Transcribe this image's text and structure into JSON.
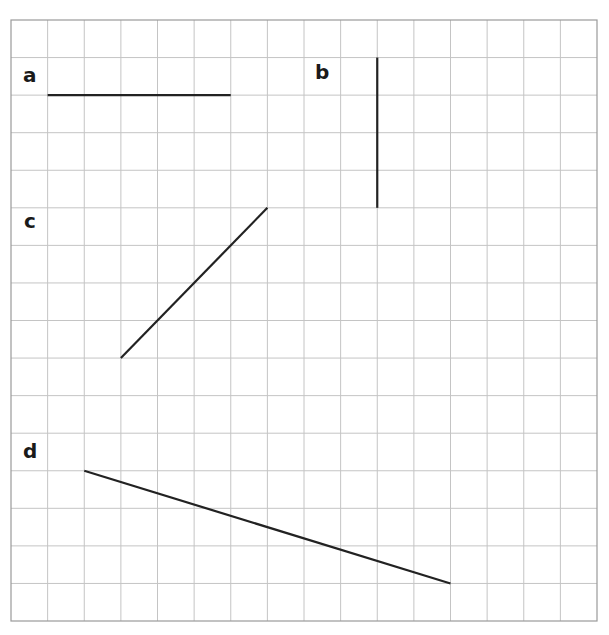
{
  "grid": {
    "columns": 16,
    "rows": 16,
    "left": 11,
    "top": 20,
    "width": 586,
    "height": 601,
    "line_color": "#c4c4c4",
    "border_color": "#9a9a9a"
  },
  "segments": [
    {
      "label": "a",
      "label_cell": [
        0,
        1
      ],
      "from": [
        1,
        2
      ],
      "to": [
        6,
        2
      ],
      "description": "horizontal line, 5 units"
    },
    {
      "label": "b",
      "label_cell": [
        8,
        1
      ],
      "from": [
        10,
        1
      ],
      "to": [
        10,
        5
      ],
      "description": "vertical line, 4 units"
    },
    {
      "label": "c",
      "label_cell": [
        0,
        5
      ],
      "from": [
        3,
        9
      ],
      "to": [
        7,
        5
      ],
      "description": "diagonal line, 4 right 4 up"
    },
    {
      "label": "d",
      "label_cell": [
        0,
        11
      ],
      "from": [
        2,
        12
      ],
      "to": [
        12,
        15
      ],
      "description": "diagonal line, 10 right 3 down"
    }
  ],
  "line_color": "#222222"
}
